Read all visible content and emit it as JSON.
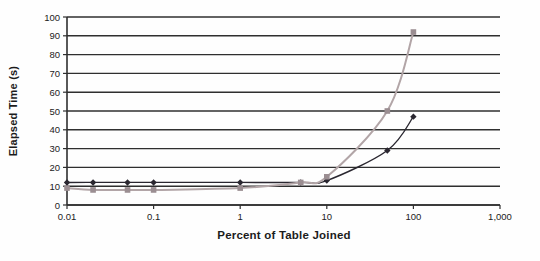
{
  "chart_data": {
    "type": "line",
    "title": "",
    "xlabel": "Percent of Table Joined",
    "ylabel": "Elapsed Time (s)",
    "x_scale": "log",
    "xlim": [
      0.01,
      1000
    ],
    "ylim": [
      0,
      100
    ],
    "x_ticks": [
      {
        "value": 0.01,
        "label": "0.01"
      },
      {
        "value": 0.1,
        "label": "0.1"
      },
      {
        "value": 1,
        "label": "1"
      },
      {
        "value": 10,
        "label": "10"
      },
      {
        "value": 100,
        "label": "100"
      },
      {
        "value": 1000,
        "label": "1,000"
      }
    ],
    "y_ticks": [
      0,
      10,
      20,
      30,
      40,
      50,
      60,
      70,
      80,
      90,
      100
    ],
    "grid": "horizontal",
    "legend": "none",
    "grid_color": "#2f2f2f",
    "axis_color": "#2f2f2f",
    "series": [
      {
        "name": "diamond-series",
        "marker": "diamond",
        "color": "#2a2730",
        "line_width": 1.4,
        "x": [
          0.01,
          0.02,
          0.05,
          0.1,
          1,
          5,
          10,
          50,
          100
        ],
        "y": [
          12,
          12,
          12,
          12,
          12,
          12,
          13,
          29,
          47
        ]
      },
      {
        "name": "square-series",
        "marker": "square",
        "color": "#9b8e92",
        "line_color": "#b2a5a7",
        "line_width": 2,
        "x": [
          0.01,
          0.02,
          0.05,
          0.1,
          1,
          5,
          10,
          50,
          100
        ],
        "y": [
          9,
          8,
          8,
          8,
          9,
          12,
          15,
          50,
          92
        ]
      }
    ]
  }
}
